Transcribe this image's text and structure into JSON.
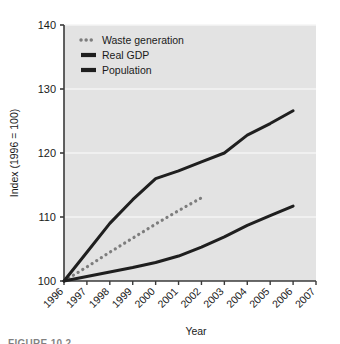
{
  "figure": {
    "caption": "FIGURE 10.2",
    "background_color": "#ffffff",
    "plot_background_color": "#e3e3e3",
    "gridline_color": "#f4f4f4",
    "axis_color": "#3a3a3a"
  },
  "chart_data": {
    "type": "line",
    "title": "",
    "xlabel": "Year",
    "ylabel": "Index (1996 = 100)",
    "x": [
      1996,
      1997,
      1998,
      1999,
      2000,
      2001,
      2002,
      2003,
      2004,
      2005,
      2006,
      2007
    ],
    "xtick_labels": [
      "1996",
      "1997",
      "1998",
      "1999",
      "2000",
      "2001",
      "2002",
      "2003",
      "2004",
      "2005",
      "2006",
      "2007"
    ],
    "xlim": [
      1996,
      2007
    ],
    "ylim": [
      100,
      140
    ],
    "ytick_labels": [
      "100",
      "110",
      "120",
      "130",
      "140"
    ],
    "yticks": [
      100,
      110,
      120,
      130,
      140
    ],
    "grid": true,
    "grid_axis": "y",
    "legend_position": "top-left",
    "series": [
      {
        "name": "Waste generation",
        "style": "dotted",
        "color": "#7d7d7d",
        "x": [
          1996,
          1997,
          1998,
          1999,
          2000,
          2001,
          2002
        ],
        "values": [
          100.0,
          102.2,
          104.5,
          106.7,
          108.9,
          111.0,
          113.0
        ]
      },
      {
        "name": "Real GDP",
        "style": "solid",
        "color": "#1f1f1f",
        "x": [
          1996,
          1997,
          1998,
          1999,
          2000,
          2001,
          2002,
          2003,
          2004,
          2005,
          2006
        ],
        "values": [
          100.0,
          104.5,
          109.0,
          112.7,
          116.0,
          117.2,
          118.6,
          120.0,
          122.8,
          124.6,
          126.6
        ]
      },
      {
        "name": "Population",
        "style": "solid",
        "color": "#1f1f1f",
        "x": [
          1996,
          1997,
          1998,
          1999,
          2000,
          2001,
          2002,
          2003,
          2004,
          2005,
          2006
        ],
        "values": [
          100.0,
          100.7,
          101.4,
          102.1,
          102.9,
          103.9,
          105.3,
          106.9,
          108.7,
          110.2,
          111.7
        ]
      }
    ]
  },
  "legend": {
    "items": [
      {
        "label": "Waste generation",
        "marker": "dotted-line-swatch"
      },
      {
        "label": "Real GDP",
        "marker": "solid-line-swatch"
      },
      {
        "label": "Population",
        "marker": "solid-line-swatch"
      }
    ]
  }
}
